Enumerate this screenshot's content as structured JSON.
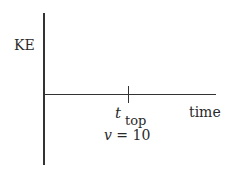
{
  "chart_data": {
    "type": "line",
    "title": "",
    "xlabel": "time",
    "ylabel": "KE",
    "series": [],
    "annotations": [
      {
        "label": "t_top",
        "symbol": "t",
        "subscript": "top",
        "position": "tick on time axis"
      },
      {
        "label": "v = 10",
        "variable": "v",
        "value": "10"
      }
    ],
    "grid": false
  },
  "axes": {
    "y_label": "KE",
    "x_label": "time"
  },
  "tick": {
    "symbol": "t",
    "subscript": "top",
    "velocity_var": "v",
    "velocity_eq": " = 10"
  }
}
